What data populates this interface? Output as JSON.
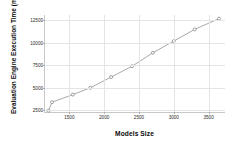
{
  "chart_data": {
    "type": "line",
    "title": "",
    "xlabel": "Models Size",
    "ylabel": "Evaluation Engine Execution Time (ms)",
    "xlim": [
      1150,
      3750
    ],
    "ylim": [
      2200,
      13100
    ],
    "grid": true,
    "legend": false,
    "marker": "circle",
    "line_color": "#9aa0a6",
    "marker_color": "#8a8a8a",
    "grid_color": "#e4e4e4",
    "axis_color": "#c8c8c8",
    "xticks": [
      {
        "value": 1500,
        "label": "1500"
      },
      {
        "value": 2000,
        "label": "2000"
      },
      {
        "value": 2500,
        "label": "2500"
      },
      {
        "value": 3000,
        "label": "3000"
      },
      {
        "value": 3500,
        "label": "3500"
      }
    ],
    "yticks": [
      {
        "value": 2500,
        "label": "2500"
      },
      {
        "value": 5000,
        "label": "5000"
      },
      {
        "value": 7500,
        "label": "7500"
      },
      {
        "value": 10000,
        "label": "10000"
      },
      {
        "value": 12500,
        "label": "12500"
      }
    ],
    "series": [
      {
        "name": "Evaluation Engine Execution Time",
        "x": [
          1200,
          1250,
          1550,
          1800,
          2100,
          2400,
          2700,
          3000,
          3300,
          3650
        ],
        "values": [
          2450,
          3400,
          4250,
          5000,
          6200,
          7400,
          8900,
          10200,
          11500,
          12700
        ]
      }
    ]
  }
}
